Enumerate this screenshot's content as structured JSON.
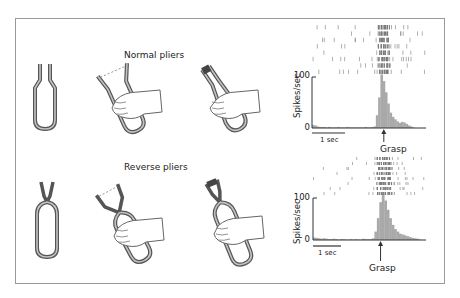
{
  "figure": {
    "rows": [
      {
        "title": "Normal pliers",
        "tools": [
          "closed-normal-pliers",
          "hand-open-normal-pliers",
          "hand-closed-normal-pliers"
        ]
      },
      {
        "title": "Reverse pliers",
        "tools": [
          "closed-reverse-pliers",
          "hand-closed-reverse-pliers",
          "hand-open-reverse-pliers"
        ]
      }
    ]
  },
  "chart_data": [
    {
      "type": "bar",
      "title": "Normal pliers neuron response (raster + PSTH)",
      "ylabel": "Spikes/sec",
      "yticks": [
        0,
        100
      ],
      "ylim": [
        0,
        110
      ],
      "scale_bar": "1 sec",
      "event_label": "Grasp",
      "bins": [
        6,
        5,
        3,
        2,
        2,
        2,
        1,
        2,
        1,
        1,
        1,
        2,
        1,
        1,
        1,
        2,
        1,
        1,
        1,
        1,
        1,
        1,
        1,
        2,
        1,
        1,
        2,
        3,
        25,
        60,
        105,
        92,
        70,
        48,
        30,
        22,
        17,
        13,
        10,
        12,
        11,
        8,
        5,
        3,
        1,
        0,
        0,
        0,
        0,
        0
      ],
      "grasp_bin": 31
    },
    {
      "type": "bar",
      "title": "Reverse pliers neuron response (raster + PSTH)",
      "ylabel": "Spikes/sec",
      "yticks": [
        0,
        100
      ],
      "ylim": [
        0,
        110
      ],
      "scale_bar": "1 sec",
      "event_label": "Grasp",
      "bins": [
        6,
        5,
        4,
        3,
        4,
        3,
        2,
        2,
        3,
        2,
        1,
        2,
        2,
        1,
        1,
        2,
        1,
        2,
        1,
        1,
        3,
        2,
        2,
        2,
        4,
        20,
        52,
        90,
        108,
        94,
        72,
        52,
        36,
        26,
        20,
        15,
        13,
        11,
        9,
        7,
        5,
        4,
        3,
        1,
        0,
        0
      ],
      "grasp_bin": 27
    }
  ],
  "labels": {
    "row1_title": "Normal pliers",
    "row2_title": "Reverse pliers",
    "ylabel": "Spikes/sec",
    "tick_100": "100",
    "tick_0": "0",
    "scale": "1 sec",
    "grasp": "Grasp"
  },
  "colors": {
    "frame": "#9a9a9a",
    "pliers_outline": "#555555",
    "pliers_fill": "#b8b8b8",
    "histogram": "#a9a9a9",
    "raster": "#7a7a7a",
    "text": "#222222"
  }
}
